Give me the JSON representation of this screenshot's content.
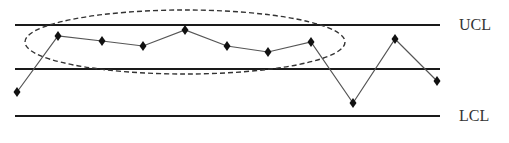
{
  "chart_data": {
    "type": "line",
    "title": "",
    "xlabel": "",
    "ylabel": "",
    "grid": false,
    "legend": null,
    "control_limits": [
      {
        "name": "UCL",
        "label": "UCL",
        "pixel_y": 25
      },
      {
        "name": "CL",
        "label": "",
        "pixel_y": 69
      },
      {
        "name": "LCL",
        "label": "LCL",
        "pixel_y": 116
      }
    ],
    "series": [
      {
        "name": "samples",
        "marker": "diamond",
        "x": [
          1,
          2,
          3,
          4,
          5,
          6,
          7,
          8,
          9,
          10,
          11
        ],
        "values": [
          -0.5,
          0.73,
          0.62,
          0.51,
          0.87,
          0.51,
          0.38,
          0.6,
          -0.76,
          0.67,
          -0.27
        ],
        "pixel_points": [
          [
            17,
            92
          ],
          [
            58,
            36
          ],
          [
            102,
            41
          ],
          [
            143,
            46
          ],
          [
            185,
            30
          ],
          [
            227,
            46
          ],
          [
            268,
            52
          ],
          [
            311,
            42
          ],
          [
            353,
            103
          ],
          [
            395,
            39
          ],
          [
            437,
            81
          ]
        ]
      }
    ],
    "annotations": [
      {
        "type": "dashed-ellipse",
        "description": "run of consecutive points above center line",
        "covers_points": [
          2,
          3,
          4,
          5,
          6,
          7,
          8
        ],
        "cx": 185,
        "cy": 42,
        "rx": 160,
        "ry": 32
      }
    ],
    "ylim": [
      -1,
      1
    ],
    "colors": {
      "limit_line": "#1a1a1a",
      "data_line": "#555555",
      "marker": "#111111",
      "ellipse": "#333333",
      "label": "#333333"
    }
  },
  "labels": {
    "ucl": "UCL",
    "lcl": "LCL"
  }
}
